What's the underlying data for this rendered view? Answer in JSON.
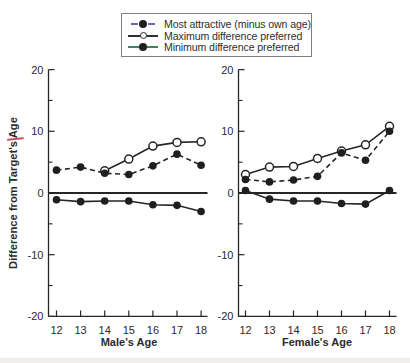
{
  "figure": {
    "y_axis_label": "Difference from Target's Age",
    "background_color": "#ffffff",
    "text_color": "#2b2b2b",
    "accent_artifact_color": "#c2333b"
  },
  "legend": {
    "items": [
      {
        "label": "Most attractive (minus own age)",
        "line_style": "dashed",
        "marker": "filled-circle",
        "swatch_line_color": "#6668b8",
        "marker_color": "#1f1f1f"
      },
      {
        "label": "Maximum difference preferred",
        "line_style": "solid",
        "marker": "open-circle",
        "swatch_line_color": "#2f2f2f",
        "marker_color": "#ffffff"
      },
      {
        "label": "Minimum difference preferred",
        "line_style": "solid",
        "marker": "filled-circle",
        "swatch_line_color": "#43815f",
        "marker_color": "#1f1f1f"
      }
    ]
  },
  "chart_data": [
    {
      "type": "line",
      "panel": "male",
      "xlabel": "Male's Age",
      "ylabel": "Difference from Target's Age",
      "xticks": [
        12,
        13,
        14,
        15,
        16,
        17,
        18
      ],
      "yticks": [
        20,
        10,
        0,
        -10,
        -20
      ],
      "yticks_minor": [
        15,
        5,
        -5,
        -15
      ],
      "ylim": [
        -20,
        20
      ],
      "zero_line": true,
      "grid": false,
      "series": [
        {
          "name": "Maximum difference preferred",
          "style": "solid",
          "marker": "open",
          "x": [
            14,
            15,
            16,
            17,
            18
          ],
          "y": [
            3.6,
            5.5,
            7.6,
            8.2,
            8.3
          ]
        },
        {
          "name": "Most attractive (minus own age)",
          "style": "dashed",
          "marker": "filled",
          "x": [
            12,
            13,
            14,
            15,
            16,
            17,
            18
          ],
          "y": [
            3.7,
            4.2,
            3.2,
            3.0,
            4.4,
            6.3,
            4.5
          ]
        },
        {
          "name": "Minimum difference preferred",
          "style": "solid",
          "marker": "filled",
          "x": [
            12,
            13,
            14,
            15,
            16,
            17,
            18
          ],
          "y": [
            -1.1,
            -1.4,
            -1.3,
            -1.3,
            -1.9,
            -2.0,
            -3.0
          ]
        }
      ]
    },
    {
      "type": "line",
      "panel": "female",
      "xlabel": "Female's Age",
      "ylabel": "Difference from Target's Age",
      "xticks": [
        12,
        13,
        14,
        15,
        16,
        17,
        18
      ],
      "yticks": [
        20,
        10,
        0,
        -10,
        -20
      ],
      "yticks_minor": [
        15,
        5,
        -5,
        -15
      ],
      "ylim": [
        -20,
        20
      ],
      "zero_line": true,
      "grid": false,
      "series": [
        {
          "name": "Maximum difference preferred",
          "style": "solid",
          "marker": "open",
          "x": [
            12,
            13,
            14,
            15,
            16,
            17,
            18
          ],
          "y": [
            3.0,
            4.2,
            4.3,
            5.6,
            6.8,
            7.8,
            10.8
          ]
        },
        {
          "name": "Most attractive (minus own age)",
          "style": "dashed",
          "marker": "filled",
          "x": [
            12,
            13,
            14,
            15,
            16,
            17,
            18
          ],
          "y": [
            2.2,
            1.8,
            2.1,
            2.7,
            6.5,
            5.3,
            10.0
          ]
        },
        {
          "name": "Minimum difference preferred",
          "style": "solid",
          "marker": "filled",
          "x": [
            12,
            13,
            14,
            15,
            16,
            17,
            18
          ],
          "y": [
            0.4,
            -1.0,
            -1.3,
            -1.3,
            -1.7,
            -1.8,
            0.4
          ]
        }
      ]
    }
  ]
}
